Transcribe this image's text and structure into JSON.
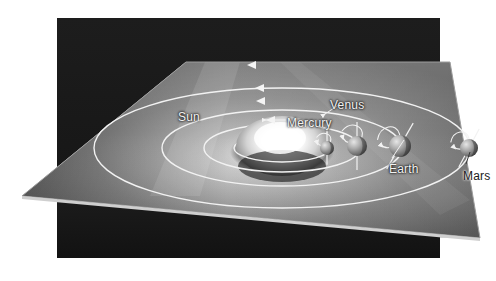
{
  "figure": {
    "background_color": "#ffffff",
    "panel_color": "#1a1a1a",
    "orbit_line_color": "#f0f0f0",
    "plane_color": "#8b8b8b",
    "sun_glow_color": "#ffffff"
  },
  "labels": [
    {
      "id": "sun",
      "text": "Sun",
      "x": 178,
      "y": 110,
      "tone": "light"
    },
    {
      "id": "mercury",
      "text": "Mercury",
      "x": 287,
      "y": 116,
      "tone": "light"
    },
    {
      "id": "venus",
      "text": "Venus",
      "x": 330,
      "y": 98,
      "tone": "light"
    },
    {
      "id": "earth",
      "text": "Earth",
      "x": 389,
      "y": 162,
      "tone": "light"
    },
    {
      "id": "mars",
      "text": "Mars",
      "x": 463,
      "y": 169,
      "tone": "dark"
    }
  ],
  "bodies": [
    {
      "id": "sun",
      "name": "Sun",
      "cx": 282,
      "cy": 148,
      "r": 46,
      "kind": "star"
    },
    {
      "id": "mercury",
      "name": "Mercury",
      "cx": 327,
      "cy": 148,
      "r": 7,
      "kind": "planet",
      "axis_tilt_deg": 0,
      "axis_style": "vertical"
    },
    {
      "id": "venus",
      "name": "Venus",
      "cx": 357,
      "cy": 146,
      "r": 10,
      "kind": "planet",
      "axis_tilt_deg": 0,
      "axis_style": "vertical"
    },
    {
      "id": "earth",
      "name": "Earth",
      "cx": 400,
      "cy": 146,
      "r": 11,
      "kind": "planet",
      "axis_tilt_deg": -30,
      "axis_style": "tilted"
    },
    {
      "id": "mars",
      "name": "Mars",
      "cx": 469,
      "cy": 148,
      "r": 9,
      "kind": "planet",
      "axis_tilt_deg": -28,
      "axis_style": "tilted"
    }
  ],
  "orbits": [
    {
      "id": "orbit-mercury",
      "body": "Mercury",
      "rx": 48,
      "ry": 14,
      "cx": 282,
      "cy": 148,
      "has_arrow": true
    },
    {
      "id": "orbit-venus",
      "body": "Venus",
      "rx": 78,
      "ry": 24,
      "cx": 282,
      "cy": 148,
      "has_arrow": true
    },
    {
      "id": "orbit-earth",
      "body": "Earth",
      "rx": 120,
      "ry": 38,
      "cx": 282,
      "cy": 148,
      "has_arrow": true
    },
    {
      "id": "orbit-mars",
      "body": "Mars",
      "rx": 188,
      "ry": 60,
      "cx": 282,
      "cy": 148,
      "has_arrow": true
    }
  ],
  "direction_arrows": [
    {
      "id": "arrow-mars",
      "x": 247,
      "y": 65,
      "direction": "left"
    },
    {
      "id": "arrow-earth",
      "x": 255,
      "y": 88,
      "direction": "left"
    },
    {
      "id": "arrow-venus",
      "x": 256,
      "y": 101,
      "direction": "left"
    },
    {
      "id": "arrow-mercury",
      "x": 266,
      "y": 120,
      "direction": "left"
    }
  ],
  "plane": {
    "id": "orbital-plane",
    "description": "Tilted grey orbital plane sheet",
    "corners": [
      [
        22,
        196
      ],
      [
        186,
        62
      ],
      [
        450,
        62
      ],
      [
        480,
        238
      ]
    ]
  }
}
